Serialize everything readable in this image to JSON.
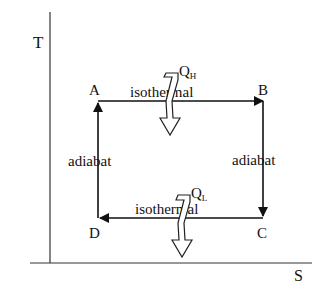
{
  "diagram": {
    "type": "T-S diagram (Carnot cycle)",
    "axes": {
      "y_label": "T",
      "x_label": "S"
    },
    "states": [
      {
        "id": "A",
        "label": "A"
      },
      {
        "id": "B",
        "label": "B"
      },
      {
        "id": "C",
        "label": "C"
      },
      {
        "id": "D",
        "label": "D"
      }
    ],
    "processes": {
      "top": {
        "from": "A",
        "to": "B",
        "label": "isothermal"
      },
      "right": {
        "from": "B",
        "to": "C",
        "label": "adiabat"
      },
      "bottom": {
        "from": "C",
        "to": "D",
        "label": "isothermal"
      },
      "left": {
        "from": "D",
        "to": "A",
        "label": "adiabat"
      }
    },
    "heat": {
      "hot": {
        "symbol": "Q",
        "subscript": "H"
      },
      "cold": {
        "symbol": "Q",
        "subscript": "L"
      }
    },
    "colors": {
      "ink": "#111111",
      "background": "#ffffff"
    }
  }
}
